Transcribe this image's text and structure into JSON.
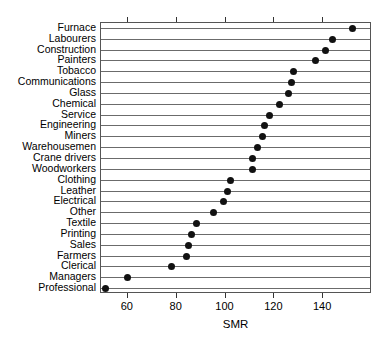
{
  "chart_data": {
    "type": "scatter",
    "title": "",
    "xlabel": "SMR",
    "ylabel": "",
    "xlim": [
      49,
      160
    ],
    "xticks": [
      60,
      80,
      100,
      120,
      140
    ],
    "xtick_labels": [
      "60",
      "80",
      "100",
      "120",
      "140"
    ],
    "grid": true,
    "legend": false,
    "orientation": "horizontal-dotchart",
    "categories": [
      "Furnace",
      "Labourers",
      "Construction",
      "Painters",
      "Tobacco",
      "Communications",
      "Glass",
      "Chemical",
      "Service",
      "Engineering",
      "Miners",
      "Warehousemen",
      "Crane drivers",
      "Woodworkers",
      "Clothing",
      "Leather",
      "Electrical",
      "Other",
      "Textile",
      "Printing",
      "Sales",
      "Farmers",
      "Clerical",
      "Managers",
      "Professional"
    ],
    "values": [
      152,
      144,
      141,
      137,
      128,
      127,
      126,
      122,
      118,
      116,
      115,
      113,
      111,
      111,
      102,
      101,
      99,
      95,
      88,
      86,
      85,
      84,
      78,
      60,
      51
    ],
    "points": [
      {
        "label": "Furnace",
        "smr": 152
      },
      {
        "label": "Labourers",
        "smr": 144
      },
      {
        "label": "Construction",
        "smr": 141
      },
      {
        "label": "Painters",
        "smr": 137
      },
      {
        "label": "Tobacco",
        "smr": 128
      },
      {
        "label": "Communications",
        "smr": 127
      },
      {
        "label": "Glass",
        "smr": 126
      },
      {
        "label": "Chemical",
        "smr": 122
      },
      {
        "label": "Service",
        "smr": 118
      },
      {
        "label": "Engineering",
        "smr": 116
      },
      {
        "label": "Miners",
        "smr": 115
      },
      {
        "label": "Warehousemen",
        "smr": 113
      },
      {
        "label": "Crane drivers",
        "smr": 111
      },
      {
        "label": "Woodworkers",
        "smr": 111
      },
      {
        "label": "Clothing",
        "smr": 102
      },
      {
        "label": "Leather",
        "smr": 101
      },
      {
        "label": "Electrical",
        "smr": 99
      },
      {
        "label": "Other",
        "smr": 95
      },
      {
        "label": "Textile",
        "smr": 88
      },
      {
        "label": "Printing",
        "smr": 86
      },
      {
        "label": "Sales",
        "smr": 85
      },
      {
        "label": "Farmers",
        "smr": 84
      },
      {
        "label": "Clerical",
        "smr": 78
      },
      {
        "label": "Managers",
        "smr": 60
      },
      {
        "label": "Professional",
        "smr": 51
      }
    ]
  },
  "style": {
    "dot_color": "#111111",
    "grid_color": "#6b6b6b",
    "axis_color": "#555555",
    "background": "#ffffff"
  }
}
